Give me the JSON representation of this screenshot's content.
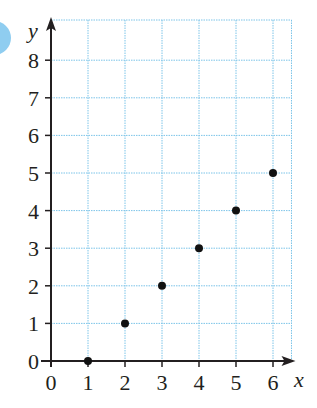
{
  "chart_data": {
    "type": "scatter",
    "title": "",
    "xlabel": "x",
    "ylabel": "y",
    "x": [
      1,
      2,
      3,
      4,
      5,
      6
    ],
    "y": [
      0,
      1,
      2,
      3,
      4,
      5
    ],
    "points": [
      {
        "x": 1,
        "y": 0
      },
      {
        "x": 2,
        "y": 1
      },
      {
        "x": 3,
        "y": 2
      },
      {
        "x": 4,
        "y": 3
      },
      {
        "x": 5,
        "y": 4
      },
      {
        "x": 6,
        "y": 5
      }
    ],
    "x_ticks": [
      "0",
      "1",
      "2",
      "3",
      "4",
      "5",
      "6"
    ],
    "y_ticks": [
      "0",
      "1",
      "2",
      "3",
      "4",
      "5",
      "6",
      "7",
      "8"
    ],
    "xlim": [
      0,
      6.5
    ],
    "ylim": [
      0,
      9
    ],
    "grid": true,
    "legend": null
  },
  "colors": {
    "grid": "#7cc4e8",
    "axis": "#231f20",
    "point": "#111111",
    "corner_circle": "#8fcdf0"
  },
  "labels": {
    "x_axis": "x",
    "y_axis": "y"
  }
}
